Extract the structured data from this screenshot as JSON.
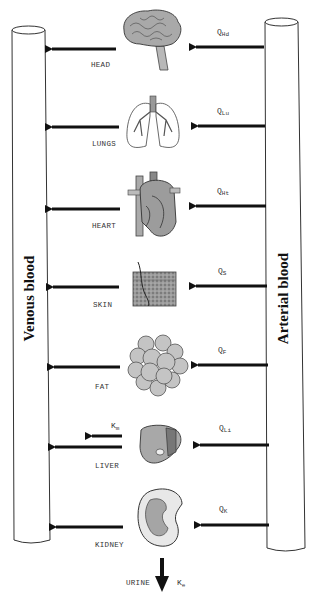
{
  "diagram": {
    "type": "pbpk-model",
    "vessels": {
      "venous": {
        "label": "Venous blood"
      },
      "arterial": {
        "label": "Arterial blood"
      }
    },
    "organs": [
      {
        "id": "head",
        "label": "HEAD",
        "flow_symbol": "Q",
        "flow_sub": "Hd",
        "icon": "brain-icon"
      },
      {
        "id": "lungs",
        "label": "LUNGS",
        "flow_symbol": "Q",
        "flow_sub": "Lu",
        "icon": "lungs-icon"
      },
      {
        "id": "heart",
        "label": "HEART",
        "flow_symbol": "Q",
        "flow_sub": "Ht",
        "icon": "heart-icon"
      },
      {
        "id": "skin",
        "label": "SKIN",
        "flow_symbol": "Q",
        "flow_sub": "S",
        "icon": "skin-icon"
      },
      {
        "id": "fat",
        "label": "FAT",
        "flow_symbol": "Q",
        "flow_sub": "F",
        "icon": "fat-icon"
      },
      {
        "id": "liver",
        "label": "LIVER",
        "flow_symbol": "Q",
        "flow_sub": "Li",
        "icon": "liver-icon",
        "metabolism": {
          "symbol": "K",
          "sub": "m"
        }
      },
      {
        "id": "kidney",
        "label": "KIDNEY",
        "flow_symbol": "Q",
        "flow_sub": "K",
        "icon": "kidney-icon"
      }
    ],
    "excretion": {
      "label": "URINE",
      "symbol": "K",
      "sub": "e"
    }
  }
}
